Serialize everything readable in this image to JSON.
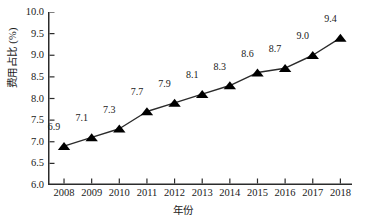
{
  "chart_data": {
    "type": "line",
    "title": "",
    "xlabel": "年份",
    "ylabel": "费用占比 (%)",
    "categories": [
      "2008",
      "2009",
      "2010",
      "2011",
      "2012",
      "2013",
      "2014",
      "2015",
      "2016",
      "2017",
      "2018"
    ],
    "values": [
      6.9,
      7.1,
      7.3,
      7.7,
      7.9,
      8.1,
      8.3,
      8.6,
      8.7,
      9.0,
      9.4
    ],
    "point_labels": [
      "6.9",
      "7.1",
      "7.3",
      "7.7",
      "7.9",
      "8.1",
      "8.3",
      "8.6",
      "8.7",
      "9.0",
      "9.4"
    ],
    "ylim": [
      6.0,
      10.0
    ],
    "ytick_values": [
      6.0,
      6.5,
      7.0,
      7.5,
      8.0,
      8.5,
      9.0,
      9.5,
      10.0
    ],
    "ytick_labels": [
      "6.0",
      "6.5",
      "7.0",
      "7.5",
      "8.0",
      "8.5",
      "9.0",
      "9.5",
      "10.0"
    ],
    "grid": false,
    "legend": false,
    "marker": "triangle",
    "marker_color": "#000000",
    "line_color": "#2b2b2b",
    "background_color": "#ffffff"
  }
}
